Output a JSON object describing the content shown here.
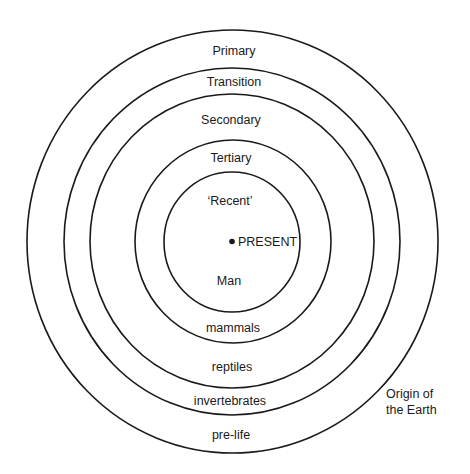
{
  "diagram": {
    "type": "concentric-circles",
    "rings": [
      {
        "name": "Primary / pre-life",
        "cx": 232.5,
        "cy": 241.5,
        "rx": 205.5,
        "ry": 211.5
      },
      {
        "name": "Transition / invertebrates",
        "cx": 232,
        "cy": 241.5,
        "rx": 168,
        "ry": 173.5
      },
      {
        "name": "Secondary / reptiles",
        "cx": 232,
        "cy": 241,
        "rx": 142,
        "ry": 147
      },
      {
        "name": "Tertiary / mammals",
        "cx": 233,
        "cy": 241.5,
        "rx": 98,
        "ry": 101.5
      },
      {
        "name": "Recent / Man",
        "cx": 232,
        "cy": 242,
        "rx": 68,
        "ry": 70
      }
    ],
    "top_labels": {
      "primary": "Primary",
      "transition": "Transition",
      "secondary": "Secondary",
      "tertiary": "Tertiary",
      "recent": "‘Recent’"
    },
    "center": {
      "present": "PRESENT"
    },
    "bottom_labels": {
      "man": "Man",
      "mammals": "mammals",
      "reptiles": "reptiles",
      "invertebrates": "invertebrates",
      "pre_life": "pre-life"
    },
    "origin": {
      "line1": "Origin of",
      "line2": "the Earth"
    },
    "colors": {
      "stroke": "#1a1a1a",
      "background": "#ffffff"
    }
  }
}
